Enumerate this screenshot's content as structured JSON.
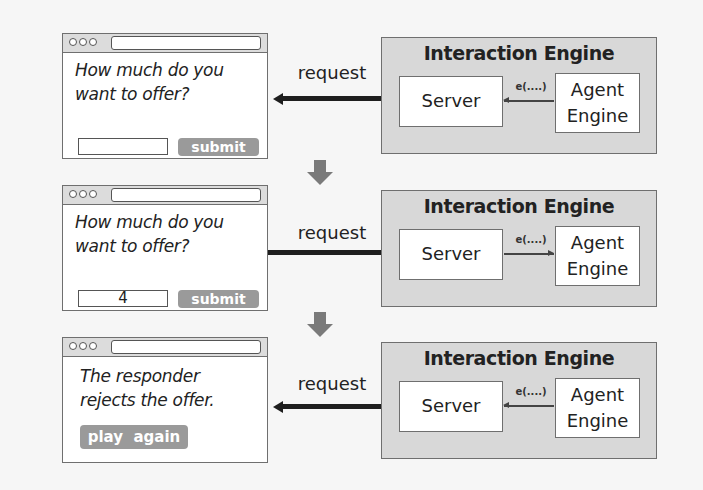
{
  "steps": [
    {
      "browser": {
        "question_line1": "How much do you",
        "question_line2": "want to offer?",
        "input_value": "",
        "button_label": "submit"
      },
      "request_label": "request",
      "request_direction": "to-browser",
      "engine": {
        "title": "Interaction Engine",
        "server_label": "Server",
        "agent_line1": "Agent",
        "agent_line2": "Engine",
        "call_label": "e(....)",
        "call_direction": "to-server"
      }
    },
    {
      "browser": {
        "question_line1": "How much do you",
        "question_line2": "want to offer?",
        "input_value": "4",
        "button_label": "submit"
      },
      "request_label": "request",
      "request_direction": "to-server",
      "engine": {
        "title": "Interaction Engine",
        "server_label": "Server",
        "agent_line1": "Agent",
        "agent_line2": "Engine",
        "call_label": "e(....)",
        "call_direction": "to-agent"
      }
    },
    {
      "browser": {
        "message_line1": "The responder",
        "message_line2": "rejects the offer.",
        "button_label": "play  again"
      },
      "request_label": "request",
      "request_direction": "to-browser",
      "engine": {
        "title": "Interaction Engine",
        "server_label": "Server",
        "agent_line1": "Agent",
        "agent_line2": "Engine",
        "call_label": "e(....)",
        "call_direction": "to-server"
      }
    }
  ],
  "colors": {
    "background": "#f6f6f6",
    "engine_fill": "#d8d8d8",
    "button_fill": "#9a9a9a",
    "arrow": "#1e1e1e",
    "step_arrow": "#7a7a7a"
  }
}
